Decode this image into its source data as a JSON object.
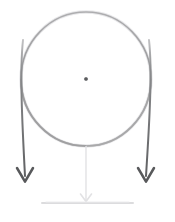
{
  "figure": {
    "background_color": "#ffffff",
    "width": 175,
    "height": 222,
    "style": "hand-drawn pencil sketch",
    "caption": ""
  },
  "colors": {
    "hoop_stroke": "#8e8e90",
    "hoop_stroke_light": "#b9b9bb",
    "arrow_stroke": "#6f7072",
    "arrow_stroke_dark": "#58595b",
    "center_dot": "#636466",
    "support_line": "#e2e2e4",
    "ground_line": "#dcdcde"
  },
  "elements": {
    "hoop": {
      "name": "hoop",
      "center_x": 86,
      "center_y": 79,
      "radius_x": 65,
      "radius_y": 67,
      "stroke_width": 1.6
    },
    "center_dot": {
      "name": "center-dot",
      "x": 86,
      "y": 79,
      "radius": 2.1
    },
    "left_arrow": {
      "name": "left-force-arrow",
      "direction": "down",
      "start_x": 23,
      "start_y": 40,
      "tip_x": 25,
      "tip_y": 181,
      "head_width": 16,
      "head_height": 13,
      "stroke_width": 2.0
    },
    "right_arrow": {
      "name": "right-force-arrow",
      "direction": "down",
      "start_x": 149,
      "start_y": 40,
      "tip_x": 146,
      "tip_y": 181,
      "head_width": 16,
      "head_height": 13,
      "stroke_width": 2.0
    },
    "support_rod": {
      "name": "support-rod",
      "x": 86,
      "top_y": 146,
      "bottom_y": 201,
      "stroke_width": 1.4
    },
    "support_tip": {
      "name": "support-tip-arrow",
      "x": 86,
      "y": 201,
      "width": 11,
      "height": 7
    },
    "ground": {
      "name": "ground-line",
      "x1": 42,
      "x2": 133,
      "y": 203,
      "stroke_width": 2.0
    }
  },
  "labels": {
    "hoop_label": "",
    "left_arrow_label": "",
    "right_arrow_label": "",
    "center_label": "",
    "ground_label": ""
  }
}
